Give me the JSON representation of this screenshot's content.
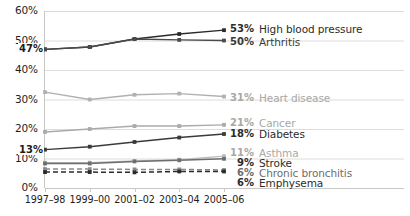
{
  "chart_data": {
    "type": "line",
    "title": "",
    "subtitle": "",
    "xlabel": "",
    "ylabel": "",
    "categories": [
      "1997–98",
      "1999–00",
      "2001–02",
      "2003–04",
      "2005–06"
    ],
    "ylim": [
      0,
      60
    ],
    "yticks": [
      "0%",
      "10%",
      "20%",
      "30%",
      "40%",
      "50%",
      "60%"
    ],
    "ytick_values": [
      0,
      10,
      20,
      30,
      40,
      50,
      60
    ],
    "grid": "horizontal",
    "legend_position": "right-inline-end-of-line",
    "annotations": [
      {
        "text": "47%",
        "series": "High blood pressure",
        "at_category": "1997–98",
        "value": 47
      },
      {
        "text": "13%",
        "series": "Diabetes",
        "at_category": "1997–98",
        "value": 13
      }
    ],
    "series": [
      {
        "name": "High blood pressure",
        "end_label": "53%",
        "end_value": 53,
        "color": "#2b2b2b",
        "label_color": "#2b2b2b",
        "style": "solid",
        "values": [
          47,
          47.8,
          50.5,
          52.2,
          53.5
        ]
      },
      {
        "name": "Arthritis",
        "end_label": "50%",
        "end_value": 50,
        "color": "#4a4a4a",
        "label_color": "#3a3a3a",
        "style": "solid",
        "values": [
          47,
          47.8,
          50.5,
          50.2,
          50
        ]
      },
      {
        "name": "Heart disease",
        "end_label": "31%",
        "end_value": 31,
        "color": "#b0b0b0",
        "label_color": "#a8a8a8",
        "style": "solid",
        "values": [
          32.5,
          30,
          31.6,
          32,
          31
        ]
      },
      {
        "name": "Cancer",
        "end_label": "21%",
        "end_value": 21,
        "color": "#aaaaaa",
        "label_color": "#a8a8a8",
        "style": "solid",
        "values": [
          19,
          20,
          21,
          21,
          21.4
        ]
      },
      {
        "name": "Diabetes",
        "end_label": "18%",
        "end_value": 18,
        "color": "#3a3a3a",
        "label_color": "#2b2b2b",
        "style": "solid",
        "values": [
          13,
          14,
          15.6,
          17.1,
          18.3
        ]
      },
      {
        "name": "Asthma",
        "end_label": "11%",
        "end_value": 11,
        "color": "#bdbdbd",
        "label_color": "#a8a8a8",
        "style": "solid",
        "values": [
          8.6,
          8.6,
          9.2,
          9.6,
          10.8
        ]
      },
      {
        "name": "Stroke",
        "end_label": "9%",
        "end_value": 9,
        "color": "#6e6e6e",
        "label_color": "#2b2b2b",
        "style": "solid",
        "values": [
          8.3,
          8.3,
          9.0,
          9.4,
          9.9
        ]
      },
      {
        "name": "Chronic bronchitis",
        "end_label": "6%",
        "end_value": 6,
        "color": "#8a8a8a",
        "label_color": "#6e6e6e",
        "style": "dashed",
        "values": [
          6.4,
          6.4,
          6.3,
          6.3,
          6.1
        ]
      },
      {
        "name": "Emphysema",
        "end_label": "6%",
        "end_value": 6,
        "color": "#2b2b2b",
        "label_color": "#2b2b2b",
        "style": "dashed",
        "values": [
          5.4,
          5.4,
          5.3,
          5.6,
          5.6
        ]
      }
    ],
    "colors": {
      "background": "#ffffff",
      "gridline": "#dcdcdc",
      "axis": "#c8c8c8",
      "text": "#1d1d1d",
      "muted_text": "#a8a8a8"
    }
  }
}
